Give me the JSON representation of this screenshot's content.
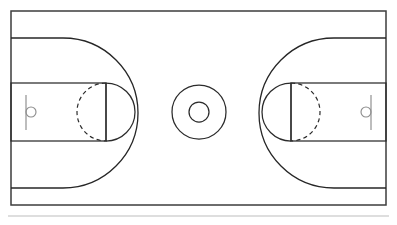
{
  "diagram": {
    "type": "line-drawing",
    "orientation": "horizontal",
    "background_color": "#ffffff",
    "line_color": "#2b2b2b",
    "accent_gray": "#8d8d8d",
    "faint_gray": "#bdbdbd",
    "stroke_width": 1.25
  },
  "canvas": {
    "width": 397,
    "height": 225
  },
  "court": {
    "name": "court-outline",
    "x": 11,
    "y": 11,
    "width": 375,
    "height": 194,
    "right": 386,
    "bottom": 205,
    "center_x": 198.5,
    "center_y": 108
  },
  "center_circle": {
    "name": "center-circle",
    "cx": 199,
    "cy": 112,
    "outer_radius": 27,
    "inner_radius": 10
  },
  "left_half": {
    "baseline_x": 11,
    "three_point": {
      "name": "left-three-point-line",
      "straight_top_y": 38,
      "straight_bottom_y": 188,
      "straight_end_x": 63,
      "arc_apex_x": 123,
      "arc_center_x": 63,
      "arc_center_y": 113,
      "arc_radius": 60
    },
    "key": {
      "name": "left-key",
      "x": 11,
      "y": 83,
      "width": 95,
      "height": 58,
      "free_throw_line_x": 106
    },
    "free_throw_circle": {
      "name": "left-free-throw-circle",
      "cx": 106,
      "cy": 112,
      "radius": 29,
      "dashed_side": "left",
      "solid_side": "right"
    },
    "hoop": {
      "name": "left-hoop",
      "backboard_x": 26,
      "backboard_top_y": 95,
      "backboard_bottom_y": 130,
      "rim_cx": 31,
      "rim_cy": 112,
      "rim_radius": 5
    }
  },
  "right_half": {
    "baseline_x": 386,
    "three_point": {
      "name": "right-three-point-line",
      "straight_top_y": 38,
      "straight_bottom_y": 188,
      "straight_end_x": 334,
      "arc_apex_x": 274,
      "arc_center_x": 334,
      "arc_center_y": 113,
      "arc_radius": 60
    },
    "key": {
      "name": "right-key",
      "x": 291,
      "y": 83,
      "width": 95,
      "height": 58,
      "free_throw_line_x": 291
    },
    "free_throw_circle": {
      "name": "right-free-throw-circle",
      "cx": 291,
      "cy": 112,
      "radius": 29,
      "dashed_side": "right",
      "solid_side": "left"
    },
    "hoop": {
      "name": "right-hoop",
      "backboard_x": 371,
      "backboard_top_y": 95,
      "backboard_bottom_y": 130,
      "rim_cx": 366,
      "rim_cy": 112,
      "rim_radius": 5
    }
  },
  "footer_rule": {
    "name": "footer-separator-line",
    "x1": 8,
    "x2": 389,
    "y": 216,
    "color": "#bdbdbd"
  }
}
